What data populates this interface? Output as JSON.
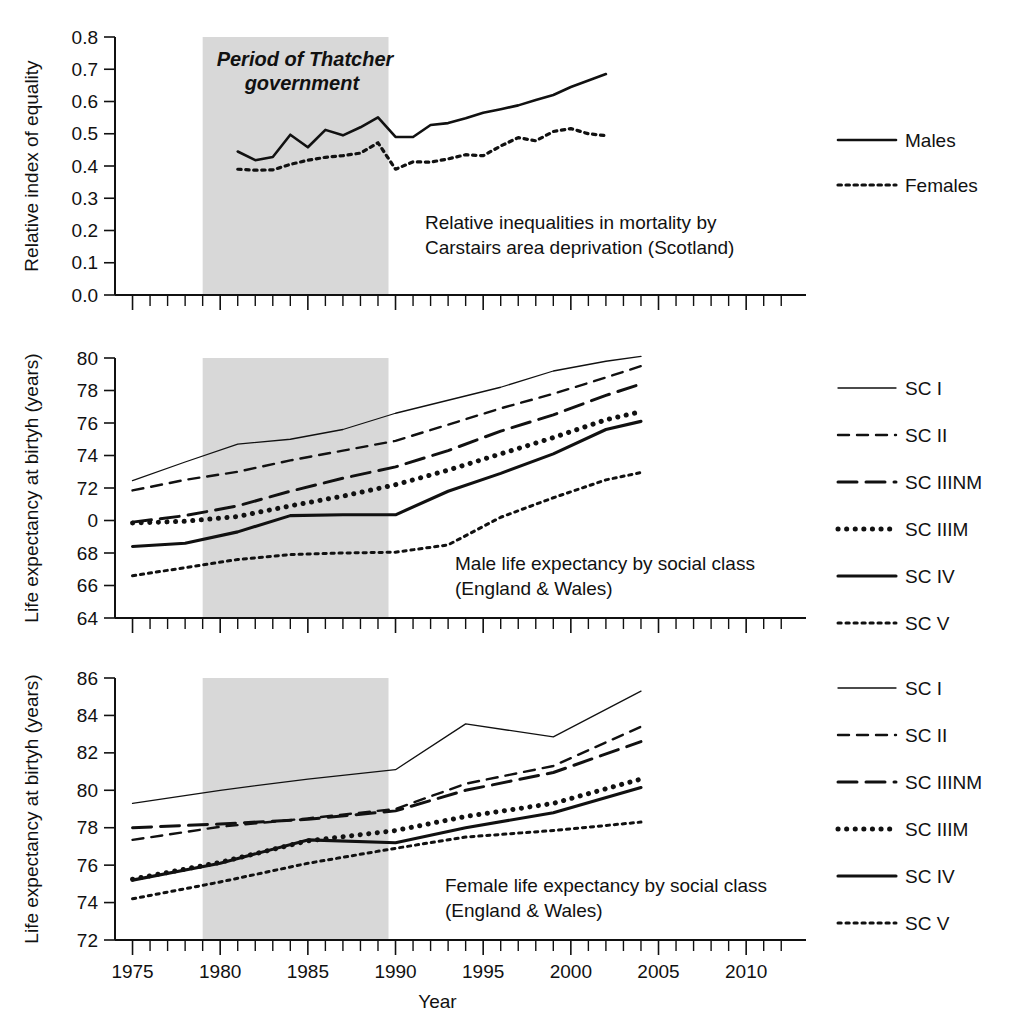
{
  "figure": {
    "xlabel": "Year",
    "xticks": [
      1975,
      1980,
      1985,
      1990,
      1995,
      2000,
      2005,
      2010
    ],
    "xlim": [
      1974,
      2012.5
    ],
    "shaded_region": {
      "label_line1": "Period of Thatcher",
      "label_line2": "government",
      "start": 1979,
      "end": 1989.6,
      "color": "#d8d8d8"
    }
  },
  "chart_data": [
    {
      "type": "line",
      "panel": "top",
      "title": "",
      "annotation_line1": "Relative inequalities in mortality by",
      "annotation_line2": "Carstairs area deprivation (Scotland)",
      "xlabel": "",
      "ylabel": "Relative index of equality",
      "ylim": [
        0.0,
        0.8
      ],
      "yticks": [
        "0.0",
        "0.1",
        "0.2",
        "0.3",
        "0.4",
        "0.5",
        "0.6",
        "0.7",
        "0.8"
      ],
      "grid": false,
      "legend_position": "right",
      "series": [
        {
          "name": "Males",
          "style": "solid",
          "x": [
            1981,
            1982,
            1983,
            1984,
            1985,
            1986,
            1987,
            1988,
            1989,
            1990,
            1991,
            1992,
            1993,
            1994,
            1995,
            1996,
            1997,
            1998,
            1999,
            2000,
            2001,
            2002
          ],
          "values": [
            0.445,
            0.418,
            0.428,
            0.497,
            0.458,
            0.512,
            0.495,
            0.52,
            0.551,
            0.49,
            0.49,
            0.527,
            0.533,
            0.548,
            0.565,
            0.576,
            0.588,
            0.605,
            0.62,
            0.645,
            0.665,
            0.685
          ]
        },
        {
          "name": "Females",
          "style": "dotted",
          "x": [
            1981,
            1982,
            1983,
            1984,
            1985,
            1986,
            1987,
            1988,
            1989,
            1990,
            1991,
            1992,
            1993,
            1994,
            1995,
            1996,
            1997,
            1998,
            1999,
            2000,
            2001,
            2002
          ],
          "values": [
            0.39,
            0.387,
            0.388,
            0.405,
            0.418,
            0.427,
            0.432,
            0.44,
            0.472,
            0.39,
            0.413,
            0.412,
            0.422,
            0.435,
            0.432,
            0.462,
            0.488,
            0.478,
            0.507,
            0.516,
            0.5,
            0.494
          ]
        }
      ]
    },
    {
      "type": "line",
      "panel": "middle",
      "title": "",
      "annotation_line1": "Male life expectancy by social class",
      "annotation_line2": "(England & Wales)",
      "xlabel": "",
      "ylabel": "Life expectancy at birtyh (years)",
      "ylim": [
        64,
        80
      ],
      "yticks": [
        "64",
        "66",
        "68",
        "0",
        "72",
        "74",
        "76",
        "78",
        "80"
      ],
      "ytick_values": [
        64,
        66,
        68,
        70,
        72,
        74,
        76,
        78,
        80
      ],
      "grid": false,
      "legend_position": "right",
      "series": [
        {
          "name": "SC I",
          "style": "thin-solid",
          "x": [
            1975,
            1978,
            1981,
            1984,
            1987,
            1990,
            1993,
            1996,
            1999,
            2002,
            2004
          ],
          "values": [
            72.45,
            73.6,
            74.7,
            75.0,
            75.6,
            76.6,
            77.4,
            78.2,
            79.2,
            79.8,
            80.1
          ]
        },
        {
          "name": "SC II",
          "style": "dashed",
          "x": [
            1975,
            1978,
            1981,
            1984,
            1987,
            1990,
            1993,
            1996,
            1999,
            2002,
            2004
          ],
          "values": [
            71.85,
            72.5,
            73.0,
            73.7,
            74.3,
            74.9,
            75.9,
            76.9,
            77.8,
            78.8,
            79.5
          ]
        },
        {
          "name": "SC IIINM",
          "style": "long-dashed",
          "x": [
            1975,
            1978,
            1981,
            1984,
            1987,
            1990,
            1993,
            1996,
            1999,
            2002,
            2004
          ],
          "values": [
            69.9,
            70.3,
            70.9,
            71.8,
            72.6,
            73.3,
            74.3,
            75.5,
            76.5,
            77.7,
            78.4
          ]
        },
        {
          "name": "SC IIIM",
          "style": "thick-dotted",
          "x": [
            1975,
            1978,
            1981,
            1984,
            1987,
            1990,
            1993,
            1996,
            1999,
            2002,
            2004
          ],
          "values": [
            69.85,
            69.95,
            70.25,
            70.9,
            71.5,
            72.2,
            73.1,
            74.1,
            75.1,
            76.2,
            76.7
          ]
        },
        {
          "name": "SC IV",
          "style": "thick-solid",
          "x": [
            1975,
            1978,
            1981,
            1984,
            1987,
            1990,
            1993,
            1996,
            1999,
            2002,
            2004
          ],
          "values": [
            68.4,
            68.6,
            69.3,
            70.3,
            70.35,
            70.35,
            71.8,
            72.9,
            74.1,
            75.6,
            76.1
          ]
        },
        {
          "name": "SC V",
          "style": "fine-dotted",
          "x": [
            1975,
            1978,
            1981,
            1984,
            1987,
            1990,
            1993,
            1996,
            1999,
            2002,
            2004
          ],
          "values": [
            66.6,
            67.1,
            67.6,
            67.9,
            68.0,
            68.05,
            68.5,
            70.2,
            71.4,
            72.5,
            72.95
          ]
        }
      ]
    },
    {
      "type": "line",
      "panel": "bottom",
      "title": "",
      "annotation_line1": "Female life expectancy by social class",
      "annotation_line2": "(England & Wales)",
      "xlabel": "Year",
      "ylabel": "Life expectancy at birtyh (years)",
      "ylim": [
        72,
        86
      ],
      "yticks": [
        "72",
        "74",
        "76",
        "78",
        "80",
        "82",
        "84",
        "86"
      ],
      "grid": false,
      "legend_position": "right",
      "series": [
        {
          "name": "SC I",
          "style": "thin-solid",
          "x": [
            1975,
            1980,
            1985,
            1990,
            1994,
            1999,
            2004
          ],
          "values": [
            79.3,
            80.0,
            80.6,
            81.1,
            83.55,
            82.85,
            85.3
          ]
        },
        {
          "name": "SC II",
          "style": "dashed",
          "x": [
            1975,
            1980,
            1985,
            1990,
            1994,
            1999,
            2004
          ],
          "values": [
            77.35,
            78.05,
            78.5,
            79.0,
            80.35,
            81.3,
            83.4
          ]
        },
        {
          "name": "SC IIINM",
          "style": "long-dashed",
          "x": [
            1975,
            1980,
            1985,
            1990,
            1994,
            1999,
            2004
          ],
          "values": [
            78.0,
            78.2,
            78.45,
            78.9,
            80.0,
            80.95,
            82.6
          ]
        },
        {
          "name": "SC IIIM",
          "style": "thick-dotted",
          "x": [
            1975,
            1980,
            1985,
            1990,
            1994,
            1999,
            2004
          ],
          "values": [
            75.25,
            76.15,
            77.3,
            77.85,
            78.6,
            79.3,
            80.6
          ]
        },
        {
          "name": "SC IV",
          "style": "thick-solid",
          "x": [
            1975,
            1980,
            1985,
            1990,
            1994,
            1999,
            2004
          ],
          "values": [
            75.2,
            76.1,
            77.35,
            77.2,
            78.0,
            78.8,
            80.15
          ]
        },
        {
          "name": "SC V",
          "style": "fine-dotted",
          "x": [
            1975,
            1980,
            1985,
            1990,
            1994,
            1999,
            2004
          ],
          "values": [
            74.2,
            75.1,
            76.1,
            76.9,
            77.5,
            77.85,
            78.3
          ]
        }
      ]
    }
  ],
  "legends": {
    "top": [
      {
        "label": "Males",
        "style": "solid"
      },
      {
        "label": "Females",
        "style": "dotted"
      }
    ],
    "middle": [
      {
        "label": "SC I",
        "style": "thin-solid"
      },
      {
        "label": "SC II",
        "style": "dashed"
      },
      {
        "label": "SC IIINM",
        "style": "long-dashed"
      },
      {
        "label": "SC IIIM",
        "style": "thick-dotted"
      },
      {
        "label": "SC IV",
        "style": "thick-solid"
      },
      {
        "label": "SC V",
        "style": "fine-dotted"
      }
    ],
    "bottom": [
      {
        "label": "SC I",
        "style": "thin-solid"
      },
      {
        "label": "SC II",
        "style": "dashed"
      },
      {
        "label": "SC IIINM",
        "style": "long-dashed"
      },
      {
        "label": "SC IIIM",
        "style": "thick-dotted"
      },
      {
        "label": "SC IV",
        "style": "thick-solid"
      },
      {
        "label": "SC V",
        "style": "fine-dotted"
      }
    ]
  }
}
